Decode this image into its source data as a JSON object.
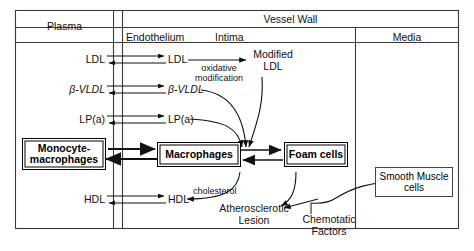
{
  "diagram": {
    "columns": [
      {
        "id": "plasma",
        "label": "Plasma"
      },
      {
        "id": "endothelium",
        "label": "Endothelium"
      },
      {
        "id": "intima",
        "label": "Intima"
      },
      {
        "id": "media",
        "label": "Media"
      }
    ],
    "super_header": {
      "label": "Vessel Wall",
      "spans": [
        "endothelium",
        "intima",
        "media"
      ]
    },
    "plasma_species": [
      {
        "id": "ldl",
        "label": "LDL"
      },
      {
        "id": "bvldl",
        "label": "β-VLDL"
      },
      {
        "id": "lpa",
        "label": "LP(a)"
      },
      {
        "id": "hdl",
        "label": "HDL"
      }
    ],
    "intima_species": [
      {
        "id": "ldl-intima",
        "label": "LDL"
      },
      {
        "id": "bvldl-intima",
        "label": "β-VLDL"
      },
      {
        "id": "lpa-intima",
        "label": "LP(a)"
      },
      {
        "id": "hdl-intima",
        "label": "HDL"
      }
    ],
    "boxes": [
      {
        "id": "monocyte-macrophages",
        "label": "Monocyte-\nmacrophages",
        "line1": "Monocyte-",
        "line2": "macrophages",
        "style": "double",
        "column": "plasma"
      },
      {
        "id": "macrophages",
        "label": "Macrophages",
        "line1": "Macrophages",
        "line2": "",
        "style": "double",
        "column": "intima"
      },
      {
        "id": "foam-cells",
        "label": "Foam cells",
        "line1": "Foam cells",
        "line2": "",
        "style": "double",
        "column": "intima"
      },
      {
        "id": "smooth-muscle-cells",
        "label": "Smooth Muscle cells",
        "line1": "Smooth  Muscle",
        "line2": "cells",
        "style": "single",
        "column": "media"
      }
    ],
    "annotations": [
      {
        "id": "modified-ldl",
        "line1": "Modified",
        "line2": "LDL"
      },
      {
        "id": "oxidative-modification",
        "line1": "oxidative",
        "line2": "modification"
      },
      {
        "id": "cholesterol",
        "line1": "cholesterol",
        "line2": ""
      },
      {
        "id": "atherosclerotic-lesion",
        "line1": "Atherosclerotic",
        "line2": "Lesion"
      },
      {
        "id": "chemotatic-factors",
        "line1": "Chemotatic",
        "line2": "Factors"
      }
    ],
    "colors": {
      "ink": "#111111",
      "frame": "#3a3a3a",
      "background": "#ffffff"
    }
  }
}
